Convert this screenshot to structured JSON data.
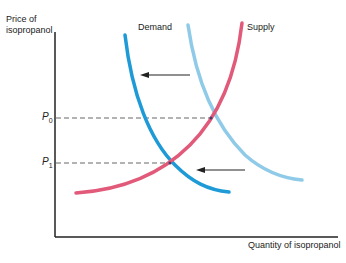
{
  "diagram": {
    "y_axis_label_line1": "Price of",
    "y_axis_label_line2": "isopropanol",
    "x_axis_label": "Quantity of isopropanol",
    "demand_label": "Demand",
    "supply_label": "Supply",
    "p0_label": "P",
    "p0_sub": "0",
    "p1_label": "P",
    "p1_sub": "1",
    "colors": {
      "demand_new": "#1e9ad6",
      "demand_old": "#8fcbe8",
      "supply": "#e25a7a",
      "axis": "#222222",
      "guide": "#666666",
      "arrow": "#222222"
    }
  }
}
